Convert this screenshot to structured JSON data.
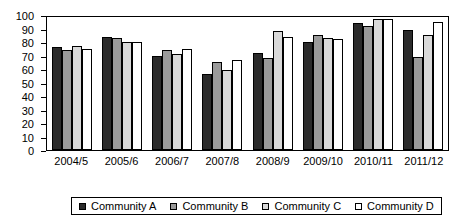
{
  "chart_data": {
    "type": "bar",
    "title": "",
    "subtitle": "",
    "xlabel": "",
    "ylabel": "",
    "ylim": [
      0,
      100
    ],
    "yticks": [
      0,
      10,
      20,
      30,
      40,
      50,
      60,
      70,
      80,
      90,
      100
    ],
    "grid": false,
    "legend_position": "bottom",
    "categories": [
      "2004/5",
      "2005/6",
      "2006/7",
      "2007/8",
      "2008/9",
      "2009/10",
      "2010/11",
      "2011/12"
    ],
    "series": [
      {
        "name": "Community A",
        "color": "#2b2b2b",
        "values": [
          76,
          84,
          70,
          56,
          72,
          80,
          94,
          89
        ]
      },
      {
        "name": "Community B",
        "color": "#9a9a9a",
        "values": [
          74,
          83,
          74,
          65,
          68,
          85,
          92,
          69
        ]
      },
      {
        "name": "Community C",
        "color": "#d9d9d9",
        "values": [
          77,
          80,
          71,
          59,
          88,
          83,
          97,
          85
        ]
      },
      {
        "name": "Community D",
        "color": "#ffffff",
        "values": [
          75,
          80,
          75,
          67,
          84,
          82,
          97,
          95
        ]
      }
    ]
  },
  "legend": {
    "items": [
      {
        "label": "Community A"
      },
      {
        "label": "Community B"
      },
      {
        "label": "Community C"
      },
      {
        "label": "Community D"
      }
    ]
  }
}
